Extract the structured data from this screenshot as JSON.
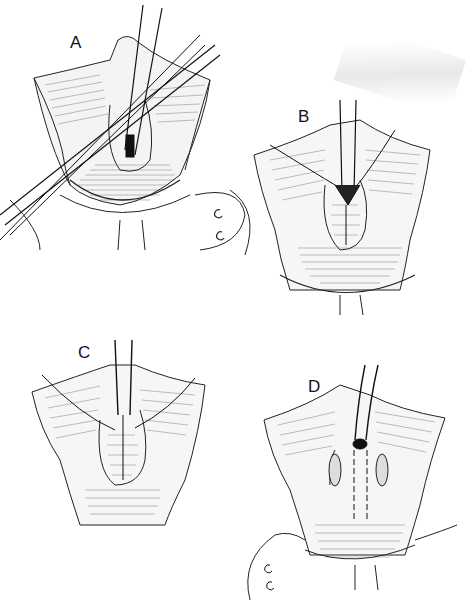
{
  "figure": {
    "type": "surgical illustration",
    "style": "black and white line drawing",
    "panels": [
      {
        "id": "A",
        "label": "A",
        "description": "Exposure with retractor and crossed forceps/scissors over incision"
      },
      {
        "id": "B",
        "label": "B",
        "description": "Traction sutures placed, tissue plicated with interrupted sutures"
      },
      {
        "id": "C",
        "label": "C",
        "description": "Continued closure with sutures under retractor"
      },
      {
        "id": "D",
        "label": "D",
        "description": "Final closure with relaxing incisions on both sides"
      }
    ]
  }
}
